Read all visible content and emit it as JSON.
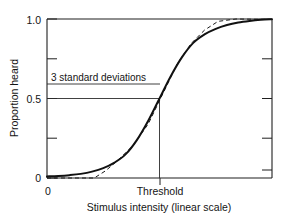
{
  "chart_data": {
    "type": "line",
    "title": "",
    "xlabel": "Stimulus intensity (linear scale)",
    "ylabel": "Proportion heard",
    "xlim": [
      0,
      1
    ],
    "ylim": [
      0,
      1
    ],
    "grid": false,
    "legend": "none",
    "x_tick_labels": [
      "0",
      "Threshold"
    ],
    "x_tick_values": [
      0,
      0.5
    ],
    "y_tick_labels": [
      "0",
      "0.5",
      "1.0"
    ],
    "y_tick_values": [
      0,
      0.5,
      1.0
    ],
    "y_minor_tick_values": [
      0.25,
      0.75
    ],
    "annotations": [
      {
        "text": "3 standard deviations",
        "x": 0.04,
        "y": 0.55,
        "guide_horizontal_y": 0.5,
        "guide_horizontal_x_range": [
          0,
          0.5
        ],
        "guide_vertical_x": 0.5,
        "guide_vertical_y_range": [
          0,
          0.5
        ]
      }
    ],
    "series": [
      {
        "name": "cumulative normal (theoretical)",
        "style": "solid",
        "x": [
          0.0,
          0.05,
          0.1,
          0.15,
          0.2,
          0.25,
          0.3,
          0.35,
          0.4,
          0.45,
          0.5,
          0.55,
          0.6,
          0.65,
          0.7,
          0.75,
          0.8,
          0.85,
          0.9,
          0.95,
          1.0
        ],
        "y": [
          0.01,
          0.013,
          0.018,
          0.026,
          0.04,
          0.062,
          0.097,
          0.15,
          0.24,
          0.36,
          0.5,
          0.64,
          0.76,
          0.85,
          0.903,
          0.938,
          0.962,
          0.978,
          0.988,
          0.995,
          0.999
        ]
      },
      {
        "name": "observed data (stepwise)",
        "style": "dashed",
        "x": [
          0.0,
          0.13,
          0.21,
          0.26,
          0.31,
          0.38,
          0.45,
          0.52,
          0.58,
          0.64,
          0.7,
          0.76,
          0.84,
          1.0
        ],
        "y": [
          0.0,
          0.0,
          0.0,
          0.045,
          0.105,
          0.2,
          0.34,
          0.545,
          0.72,
          0.845,
          0.93,
          0.985,
          1.0,
          0.997
        ]
      }
    ]
  },
  "axes": {
    "y_label": "Proportion heard",
    "x_label": "Stimulus intensity (linear scale)",
    "y_ticks": [
      "1.0",
      "0.5",
      "0"
    ],
    "x_ticks": [
      "0",
      "Threshold"
    ]
  },
  "annotation": {
    "standard_deviations_label": "3 standard deviations"
  }
}
